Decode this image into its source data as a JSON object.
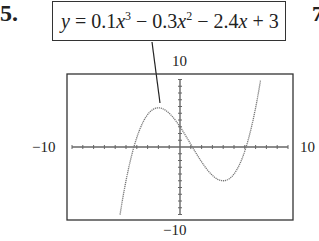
{
  "problem_number": "5.",
  "next_problem_partial": "7",
  "equation": {
    "text": "y = 0.1x^3 − 0.3x^2 − 2.4x + 3",
    "parts": [
      "y",
      " = 0.1",
      "x",
      "3",
      " − 0.3",
      "x",
      "2",
      " − 2.4",
      "x",
      " + 3"
    ]
  },
  "window_labels": {
    "ymax": "10",
    "ymin": "−10",
    "xmin": "−10",
    "xmax": "10"
  },
  "chart_data": {
    "type": "line",
    "xlabel": "",
    "ylabel": "",
    "xlim": [
      -10,
      10
    ],
    "ylim": [
      -10,
      10
    ],
    "x_ticks_step": 1,
    "y_ticks_step": 1,
    "grid": false,
    "legend": null,
    "function": "0.1*x^3 - 0.3*x^2 - 2.4*x + 3",
    "x": [
      -5,
      -4,
      -3,
      -2,
      -1,
      0,
      1,
      2,
      3,
      4,
      5,
      6,
      7
    ],
    "y": [
      -9.0,
      -1.4,
      2.4,
      3.8,
      4.0,
      3.0,
      0.4,
      -1.6,
      -2.7,
      -2.8,
      -1.5,
      1.8,
      6.6
    ],
    "key_points": {
      "local_max": {
        "x": -2,
        "y": 3.8
      },
      "local_min": {
        "x": 4,
        "y": -5
      },
      "y_intercept": {
        "x": 0,
        "y": 3
      },
      "x_intercepts": [
        -4.5,
        1.1,
        6.4
      ]
    }
  }
}
